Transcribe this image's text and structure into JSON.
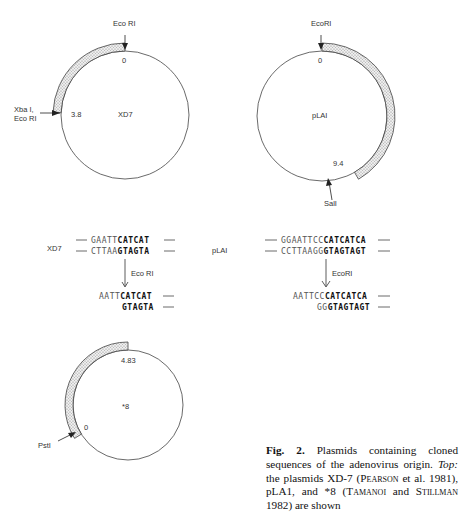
{
  "plasmids": [
    {
      "name": "XD7",
      "top_site": "Eco RI",
      "start_label": "0",
      "end_label": "3.8",
      "end_site_line1": "Xba I,",
      "end_site_line2": "Eco RI"
    },
    {
      "name": "pLAI",
      "top_site": "EcoRI",
      "start_label": "0",
      "end_label": "9.4",
      "end_site": "SalI"
    },
    {
      "name": "*8",
      "start_label": "0",
      "end_label": "4.83",
      "start_site": "PstI"
    }
  ],
  "sequences": {
    "xd7": {
      "label": "XD7",
      "top_plain": "GAATT",
      "top_bold": "CATCAT",
      "bottom_plain": "CTTAA",
      "bottom_bold": "GTAGTA",
      "enzyme": "Eco RI",
      "cut_top_plain": "AATT",
      "cut_top_bold": "CATCAT",
      "cut_bottom_plain": "",
      "cut_bottom_bold": "GTAGTA"
    },
    "plai": {
      "label": "pLAI",
      "top_plain": "GGAATTCC",
      "top_bold": "CATCATCA",
      "bottom_plain": "CCTTAAGG",
      "bottom_bold": "GTAGTAGT",
      "enzyme": "EcoRI",
      "cut_top_plain": "AATTCC",
      "cut_top_bold": "CATCATCA",
      "cut_bottom_plain": "GG",
      "cut_bottom_bold": "GTAGTAGT"
    }
  },
  "caption": {
    "fig_label": "Fig. 2.",
    "text1": " Plasmids containing cloned sequences of the adenovirus origin. ",
    "top_label": "Top:",
    "text2": " the plasmids XD-7 (",
    "author1": "Pearson",
    "text3": " et al. 1981), pLA1, and *8 (",
    "author2": "Tamanoi",
    "text4": " and ",
    "author3": "Stillman",
    "text5": " 1982) are shown"
  }
}
